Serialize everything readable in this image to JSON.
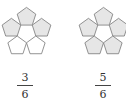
{
  "figures": [
    {
      "name": "left",
      "shaded": [
        true,
        true,
        true,
        false,
        false
      ],
      "center_shaded": false,
      "fraction": {
        "numerator": "3",
        "denominator": "6"
      }
    },
    {
      "name": "right",
      "shaded": [
        true,
        true,
        true,
        true,
        true
      ],
      "center_shaded": false,
      "fraction": {
        "numerator": "5",
        "denominator": "6"
      }
    }
  ],
  "colors": {
    "shade": "#e6e6e6",
    "stroke": "#777777",
    "blank": "#ffffff"
  }
}
